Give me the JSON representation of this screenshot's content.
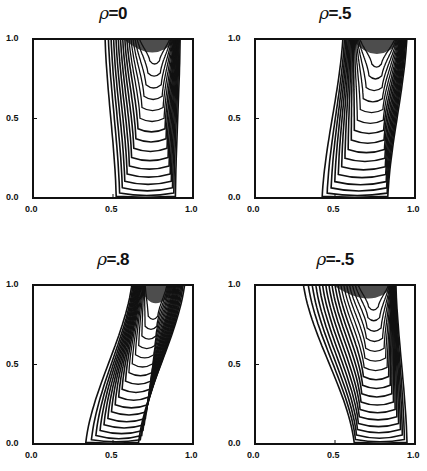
{
  "chart_data": {
    "type": "contour",
    "layout": {
      "rows": 2,
      "cols": 2
    },
    "panels": [
      {
        "title_symbol": "ρ",
        "title_value": "=0",
        "rho": 0,
        "xlim": [
          0,
          1
        ],
        "ylim": [
          0,
          1
        ],
        "xticks": [
          "0.0",
          "0.5",
          "1.0"
        ],
        "yticks": [
          "0.0",
          "0.5",
          "1.0"
        ],
        "box": {
          "x": 33,
          "y": 39,
          "w": 160,
          "h": 159
        },
        "levels": 16,
        "outer": {
          "left_top": 0.45,
          "left_bot": 0.52,
          "right_top": 0.92,
          "right_bot": 0.89,
          "bottom": 0.01
        },
        "apex": {
          "x": 0.76,
          "y": 0.88,
          "left_top": 0.66,
          "right_top": 0.86,
          "bottom": 0.1
        },
        "grid": false
      },
      {
        "title_symbol": "ρ",
        "title_value": "=.5",
        "rho": 0.5,
        "xlim": [
          0,
          1
        ],
        "ylim": [
          0,
          1
        ],
        "xticks": [
          "0.0",
          "0.5",
          "1.0"
        ],
        "yticks": [
          "0.0",
          "0.5",
          "1.0"
        ],
        "box": {
          "x": 255,
          "y": 39,
          "w": 160,
          "h": 159
        },
        "levels": 16,
        "outer": {
          "left_top": 0.55,
          "left_bot": 0.42,
          "right_top": 0.95,
          "right_bot": 0.83,
          "bottom": 0.01
        },
        "apex": {
          "x": 0.76,
          "y": 0.86,
          "left_top": 0.65,
          "right_top": 0.88,
          "bottom": 0.12
        },
        "grid": false
      },
      {
        "title_symbol": "ρ",
        "title_value": "=.8",
        "rho": 0.8,
        "xlim": [
          0,
          1
        ],
        "ylim": [
          0,
          1
        ],
        "xticks": [
          "0.0",
          "0.5",
          "1.0"
        ],
        "yticks": [
          "0.0",
          "0.5",
          "1.0"
        ],
        "box": {
          "x": 33,
          "y": 285,
          "w": 160,
          "h": 159
        },
        "levels": 18,
        "outer": {
          "left_top": 0.62,
          "left_bot": 0.33,
          "right_top": 0.95,
          "right_bot": 0.66,
          "bottom": 0.01
        },
        "apex": {
          "x": 0.75,
          "y": 0.82,
          "left_top": 0.7,
          "right_top": 0.84,
          "bottom": 0.25
        },
        "grid": false
      },
      {
        "title_symbol": "ρ",
        "title_value": "=-.5",
        "rho": -0.5,
        "xlim": [
          0,
          1
        ],
        "ylim": [
          0,
          1
        ],
        "xticks": [
          "0.0",
          "0.5",
          "1.0"
        ],
        "yticks": [
          "0.0",
          "0.5",
          "1.0"
        ],
        "box": {
          "x": 255,
          "y": 285,
          "w": 160,
          "h": 159
        },
        "levels": 18,
        "outer": {
          "left_top": 0.3,
          "left_bot": 0.62,
          "right_top": 0.88,
          "right_bot": 0.95,
          "bottom": 0.01
        },
        "apex": {
          "x": 0.74,
          "y": 0.88,
          "left_top": 0.64,
          "right_top": 0.84,
          "bottom": 0.1
        },
        "grid": false
      }
    ]
  },
  "colors": {
    "line": "#111111",
    "background": "#ffffff"
  }
}
